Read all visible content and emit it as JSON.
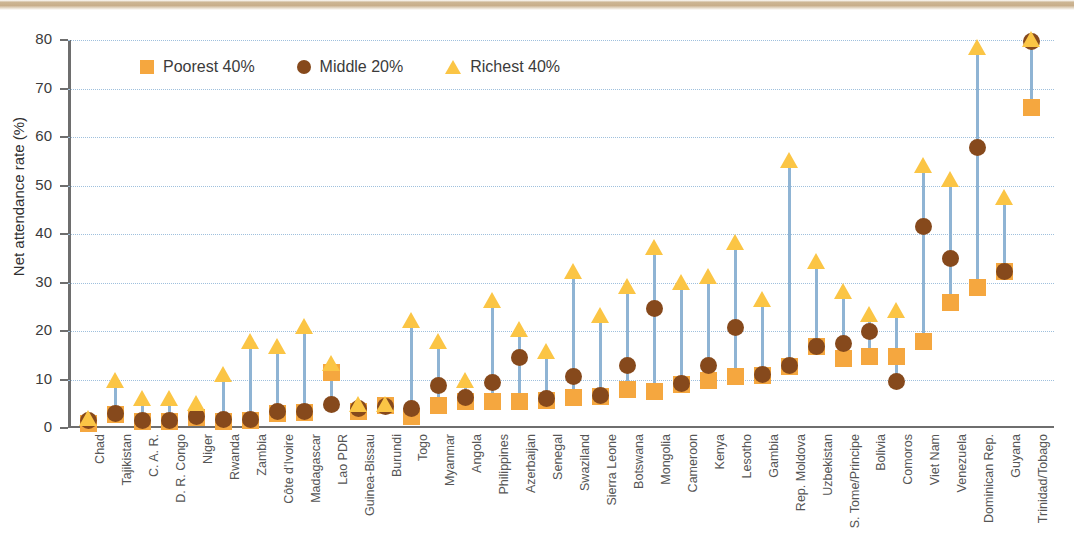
{
  "chart_data": {
    "type": "scatter",
    "title": "",
    "xlabel": "",
    "ylabel": "Net attendance rate (%)",
    "ylim": [
      0,
      80
    ],
    "yticks": [
      0,
      10,
      20,
      30,
      40,
      50,
      60,
      70,
      80
    ],
    "grid": true,
    "legend_position": "top-left",
    "legend": [
      "Poorest 40%",
      "Middle 20%",
      "Richest 40%"
    ],
    "colors": {
      "poorest": "#f5a73f",
      "middle": "#86491c",
      "richest": "#fbc545",
      "connector": "#8fb4d4",
      "gridline": "#9fc0dd",
      "axis": "#6e6e6e",
      "top_band": "#c8ae8b"
    },
    "categories": [
      "Chad",
      "Tajikistan",
      "C. A. R.",
      "D. R. Congo",
      "Niger",
      "Rwanda",
      "Zambia",
      "Côte d'Ivoire",
      "Madagascar",
      "Lao PDR",
      "Guinea-Bissau",
      "Burundi",
      "Togo",
      "Myanmar",
      "Angola",
      "Philippines",
      "Azerbaijan",
      "Senegal",
      "Swaziland",
      "Sierra Leone",
      "Botswana",
      "Mongolia",
      "Cameroon",
      "Kenya",
      "Lesotho",
      "Gambia",
      "Rep. Moldova",
      "Uzbekistan",
      "S. Tome/Principe",
      "Bolivia",
      "Comoros",
      "Viet Nam",
      "Venezuela",
      "Dominican Rep.",
      "Guyana",
      "Trinidad/Tobago"
    ],
    "series": [
      {
        "name": "Poorest 40%",
        "marker": "square",
        "color": "#f5a73f",
        "values": [
          0.8,
          2.7,
          1.2,
          1.2,
          2.0,
          1.3,
          1.4,
          2.9,
          3.0,
          11.3,
          3.2,
          4.6,
          2.3,
          4.6,
          5.4,
          5.3,
          5.4,
          5.6,
          6.2,
          6.3,
          7.8,
          7.5,
          8.8,
          9.7,
          10.6,
          10.8,
          12.6,
          16.7,
          14.2,
          14.7,
          14.7,
          17.7,
          25.7,
          28.9,
          32.2,
          65.9
        ]
      },
      {
        "name": "Middle 20%",
        "marker": "circle",
        "color": "#86491c",
        "values": [
          1.5,
          2.8,
          1.4,
          1.4,
          2.2,
          1.7,
          1.7,
          3.4,
          3.4,
          4.7,
          4.0,
          4.4,
          3.9,
          8.6,
          6.2,
          9.3,
          14.4,
          5.9,
          10.6,
          6.5,
          12.7,
          24.5,
          9.0,
          12.7,
          20.6,
          11.0,
          12.8,
          16.8,
          17.4,
          19.8,
          9.5,
          41.5,
          34.8,
          57.7,
          32.2,
          79.5
        ]
      },
      {
        "name": "Richest 40%",
        "marker": "triangle",
        "color": "#fbc545",
        "values": [
          2.1,
          10.0,
          6.2,
          6.2,
          5.2,
          11.2,
          18.0,
          16.9,
          21.0,
          13.4,
          4.9,
          4.9,
          22.2,
          18.0,
          10.0,
          26.4,
          20.5,
          15.9,
          32.4,
          23.2,
          29.3,
          37.3,
          30.2,
          31.4,
          38.4,
          26.6,
          55.3,
          34.4,
          28.2,
          23.5,
          24.4,
          54.3,
          51.3,
          78.6,
          47.6,
          80.2
        ]
      }
    ]
  }
}
